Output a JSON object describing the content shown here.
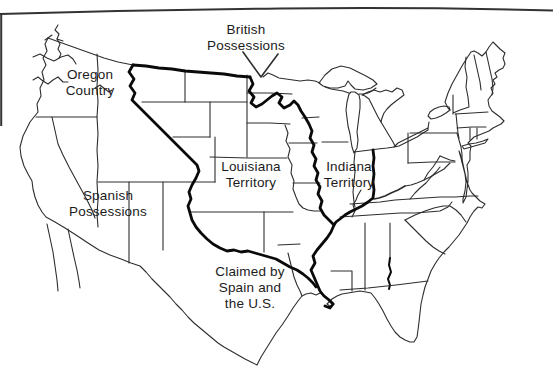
{
  "figure": {
    "type": "historical-us-territories-map",
    "labels": {
      "british_possessions": {
        "lines": [
          "British",
          "Possessions"
        ]
      },
      "oregon_country": {
        "lines": [
          "Oregon",
          "Country"
        ]
      },
      "louisiana_territory": {
        "lines": [
          "Louisiana",
          "Territory"
        ]
      },
      "indiana_territory": {
        "lines": [
          "Indiana",
          "Territory"
        ]
      },
      "spanish_possessions": {
        "lines": [
          "Spanish",
          "Possessions"
        ]
      },
      "claimed_spain_us": {
        "lines": [
          "Claimed by",
          "Spain and",
          "the U.S."
        ]
      }
    },
    "colors": {
      "background": "#ffffff",
      "line": "#2e2e2e",
      "thick_line": "#0a0a0a",
      "text": "#1b1b1b",
      "rule": "#333333"
    }
  }
}
